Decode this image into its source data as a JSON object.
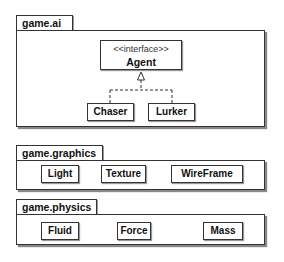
{
  "packages": [
    {
      "name": "game.ai",
      "interface": {
        "stereotype": "<<interface>>",
        "name": "Agent"
      },
      "classes": [
        "Chaser",
        "Lurker"
      ],
      "relations": [
        {
          "from": "Chaser",
          "to": "Agent",
          "type": "realization"
        },
        {
          "from": "Lurker",
          "to": "Agent",
          "type": "realization"
        }
      ]
    },
    {
      "name": "game.graphics",
      "classes": [
        "Light",
        "Texture",
        "WireFrame"
      ]
    },
    {
      "name": "game.physics",
      "classes": [
        "Fluid",
        "Force",
        "Mass"
      ]
    }
  ]
}
